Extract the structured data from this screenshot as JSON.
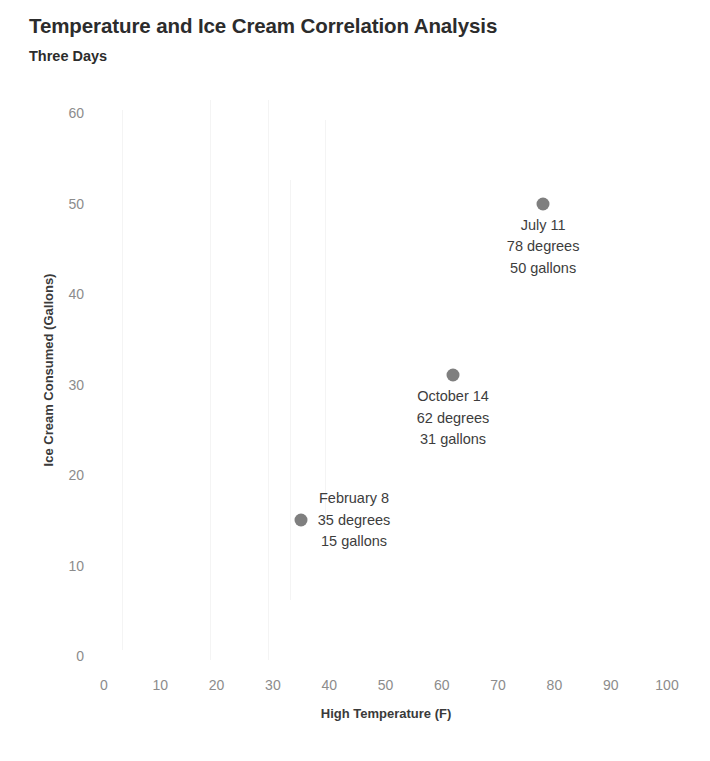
{
  "chart_data": {
    "type": "scatter",
    "title": "Temperature and Ice Cream Correlation Analysis",
    "subtitle": "Three Days",
    "xlabel": "High Temperature (F)",
    "ylabel": "Ice Cream Consumed (Gallons)",
    "xlim": [
      0,
      100
    ],
    "ylim": [
      0,
      60
    ],
    "xticks": [
      "0",
      "10",
      "20",
      "30",
      "40",
      "50",
      "60",
      "70",
      "80",
      "90",
      "100"
    ],
    "yticks": [
      "0",
      "10",
      "20",
      "30",
      "40",
      "50",
      "60"
    ],
    "grid": false,
    "legend": false,
    "marker_color": "#7f7f7f",
    "points": [
      {
        "date": "February 8",
        "x": 35,
        "y": 15,
        "degrees_label": "35 degrees",
        "gallons_label": "15 gallons",
        "label_position": "right-of-marker"
      },
      {
        "date": "October 14",
        "x": 62,
        "y": 31,
        "degrees_label": "62 degrees",
        "gallons_label": "31 gallons",
        "label_position": "below-marker"
      },
      {
        "date": "July 11",
        "x": 78,
        "y": 50,
        "degrees_label": "78 degrees",
        "gallons_label": "50 gallons",
        "label_position": "below-marker"
      }
    ]
  },
  "colors": {
    "title": "#2c2c2c",
    "axis_title": "#3a3a3a",
    "tick": "#8c8c8c",
    "marker": "#7f7f7f",
    "annotation": "#3d3d3d",
    "background": "#ffffff"
  }
}
